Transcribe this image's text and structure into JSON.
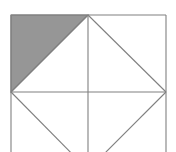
{
  "figure": {
    "canvas": {
      "width": 176,
      "height": 152
    },
    "colors": {
      "background": "#ffffff",
      "stroke": "#808080",
      "shade_fill": "#969696",
      "shade_stroke": "#808080"
    },
    "stroke_width": 1.1,
    "square": {
      "label": "outer-square",
      "left": 11,
      "top": 15,
      "right": 166,
      "bottom": 170,
      "side_length": 155,
      "note": "bottom edge falls outside the 152px image frame"
    },
    "points": {
      "top_left": {
        "name": "A",
        "x": 11,
        "y": 15
      },
      "top_right": {
        "name": "B",
        "x": 166,
        "y": 15
      },
      "bottom_right": {
        "name": "C",
        "x": 166,
        "y": 170
      },
      "bottom_left": {
        "name": "D",
        "x": 11,
        "y": 170
      },
      "top_mid": {
        "name": "M_top",
        "x": 88,
        "y": 15
      },
      "right_mid": {
        "name": "M_right",
        "x": 166,
        "y": 92
      },
      "bottom_mid": {
        "name": "M_bottom",
        "x": 88,
        "y": 170
      },
      "left_mid": {
        "name": "M_left",
        "x": 11,
        "y": 92
      },
      "center": {
        "name": "O",
        "x": 88,
        "y": 92
      }
    },
    "shaded_region": {
      "label": "upper-left-triangle",
      "fill": "#969696",
      "vertices": [
        {
          "x": 11,
          "y": 15
        },
        {
          "x": 88,
          "y": 15
        },
        {
          "x": 11,
          "y": 92
        }
      ],
      "polygon": "11,15 88,15 11,92"
    },
    "diamond": {
      "label": "inscribed-diamond",
      "polygon": "88,15 166,92 88,170 11,92"
    },
    "median_lines": [
      {
        "name": "vertical-median",
        "x1": 88,
        "y1": 15,
        "x2": 88,
        "y2": 170
      },
      {
        "name": "horizontal-median",
        "x1": 11,
        "y1": 92,
        "x2": 166,
        "y2": 92
      }
    ],
    "square_edges": [
      {
        "name": "top-edge",
        "x1": 11,
        "y1": 15,
        "x2": 166,
        "y2": 15
      },
      {
        "name": "right-edge",
        "x1": 166,
        "y1": 15,
        "x2": 166,
        "y2": 170
      },
      {
        "name": "bottom-edge",
        "x1": 11,
        "y1": 170,
        "x2": 166,
        "y2": 170
      },
      {
        "name": "left-edge",
        "x1": 11,
        "y1": 15,
        "x2": 11,
        "y2": 170
      }
    ],
    "diamond_edges": [
      {
        "name": "diamond-edge-upper-left",
        "x1": 88,
        "y1": 15,
        "x2": 11,
        "y2": 92
      },
      {
        "name": "diamond-edge-upper-right",
        "x1": 88,
        "y1": 15,
        "x2": 166,
        "y2": 92
      },
      {
        "name": "diamond-edge-lower-right",
        "x1": 166,
        "y1": 92,
        "x2": 88,
        "y2": 170
      },
      {
        "name": "diamond-edge-lower-left",
        "x1": 11,
        "y1": 92,
        "x2": 88,
        "y2": 170
      }
    ]
  }
}
